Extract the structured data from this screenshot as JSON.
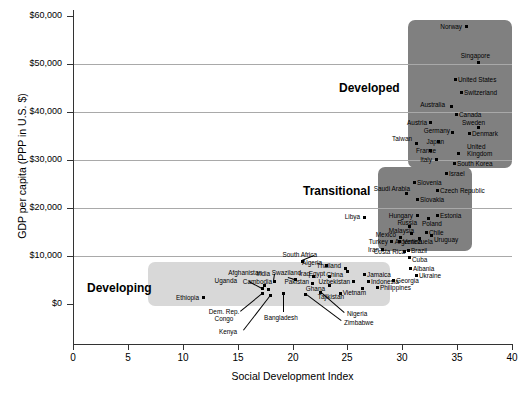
{
  "chart_data": {
    "type": "scatter",
    "title": "",
    "xlabel": "Social Development Index",
    "ylabel": "GDP per capita (PPP in U.S. $)",
    "xlim": [
      0,
      40
    ],
    "ylim": [
      -10000,
      60000
    ],
    "xticks": [
      0,
      5,
      10,
      15,
      20,
      25,
      30,
      35,
      40
    ],
    "xtick_labels": [
      "0",
      "5",
      "10",
      "15",
      "20",
      "25",
      "30",
      "35",
      "40"
    ],
    "yticks": [
      0,
      10000,
      20000,
      30000,
      40000,
      50000,
      60000
    ],
    "ytick_labels": [
      "$0",
      "$10,000",
      "$20,000",
      "$30,000",
      "$40,000",
      "$50,000",
      "$60,000"
    ],
    "grid": "horizontal",
    "legend": "none",
    "groups": [
      {
        "name": "Developing",
        "label": "Developing",
        "color": "#d8d8d8"
      },
      {
        "name": "Transitional",
        "label": "Transitional",
        "color": "#808080"
      },
      {
        "name": "Developed",
        "label": "Developed",
        "color": "#808080"
      }
    ],
    "points": [
      {
        "name": "Norway",
        "x": 32.0,
        "y": 57500,
        "group": "Developed"
      },
      {
        "name": "Singapore",
        "x": 33.2,
        "y": 49500,
        "group": "Developed"
      },
      {
        "name": "United States",
        "x": 32.3,
        "y": 45500,
        "group": "Developed"
      },
      {
        "name": "Switzerland",
        "x": 33.3,
        "y": 42800,
        "group": "Developed"
      },
      {
        "name": "Australia",
        "x": 32.7,
        "y": 40300,
        "group": "Developed"
      },
      {
        "name": "Canada",
        "x": 32.2,
        "y": 38800,
        "group": "Developed"
      },
      {
        "name": "Austria",
        "x": 31.6,
        "y": 37000,
        "group": "Developed"
      },
      {
        "name": "Sweden",
        "x": 33.3,
        "y": 36800,
        "group": "Developed"
      },
      {
        "name": "Germany",
        "x": 32.4,
        "y": 35600,
        "group": "Developed"
      },
      {
        "name": "Denmark",
        "x": 33.3,
        "y": 35400,
        "group": "Developed"
      },
      {
        "name": "Taiwan",
        "x": 29.9,
        "y": 34600,
        "group": "Developed"
      },
      {
        "name": "Japan",
        "x": 31.5,
        "y": 34000,
        "group": "Developed"
      },
      {
        "name": "United Kingdom",
        "x": 32.6,
        "y": 33200,
        "group": "Developed"
      },
      {
        "name": "France",
        "x": 31.6,
        "y": 32800,
        "group": "Developed"
      },
      {
        "name": "Italy",
        "x": 31.4,
        "y": 31400,
        "group": "Developed"
      },
      {
        "name": "South Korea",
        "x": 32.3,
        "y": 30700,
        "group": "Developed"
      },
      {
        "name": "Israel",
        "x": 31.8,
        "y": 28700,
        "group": "Developed"
      },
      {
        "name": "Slovenia",
        "x": 30.8,
        "y": 26700,
        "group": "Transitional"
      },
      {
        "name": "Saudi Arabia",
        "x": 30.0,
        "y": 25200,
        "group": "Transitional"
      },
      {
        "name": "Czech Republic",
        "x": 32.0,
        "y": 25000,
        "group": "Transitional"
      },
      {
        "name": "Slovakia",
        "x": 30.7,
        "y": 23200,
        "group": "Transitional"
      },
      {
        "name": "Hungary",
        "x": 30.5,
        "y": 19400,
        "group": "Transitional"
      },
      {
        "name": "Estonia",
        "x": 31.9,
        "y": 19300,
        "group": "Transitional"
      },
      {
        "name": "Poland",
        "x": 31.0,
        "y": 18300,
        "group": "Transitional"
      },
      {
        "name": "Russia",
        "x": 29.9,
        "y": 17700,
        "group": "Transitional"
      },
      {
        "name": "Libya",
        "x": 26.3,
        "y": 17200,
        "group": "Transitional"
      },
      {
        "name": "Malaysia",
        "x": 30.1,
        "y": 16100,
        "group": "Transitional"
      },
      {
        "name": "Chile",
        "x": 31.2,
        "y": 15700,
        "group": "Transitional"
      },
      {
        "name": "Uruguay",
        "x": 31.6,
        "y": 15000,
        "group": "Transitional"
      },
      {
        "name": "Mexico",
        "x": 29.1,
        "y": 14900,
        "group": "Transitional"
      },
      {
        "name": "Venezuela",
        "x": 29.7,
        "y": 13700,
        "group": "Transitional"
      },
      {
        "name": "Argentina",
        "x": 30.7,
        "y": 13800,
        "group": "Transitional"
      },
      {
        "name": "Turkey",
        "x": 28.2,
        "y": 13600,
        "group": "Transitional"
      },
      {
        "name": "Iran",
        "x": 26.9,
        "y": 12600,
        "group": "Transitional"
      },
      {
        "name": "Brazil",
        "x": 29.6,
        "y": 11300,
        "group": "Transitional"
      },
      {
        "name": "Costa Rica",
        "x": 28.9,
        "y": 11200,
        "group": "Transitional"
      },
      {
        "name": "Cuba",
        "x": 29.8,
        "y": 9900,
        "group": "Transitional"
      },
      {
        "name": "South Africa",
        "x": 23.8,
        "y": 10500,
        "group": "Developing"
      },
      {
        "name": "Albania",
        "x": 30.2,
        "y": 8700,
        "group": "Transitional"
      },
      {
        "name": "Ukraine",
        "x": 31.0,
        "y": 8000,
        "group": "Transitional"
      },
      {
        "name": "Thailand",
        "x": 25.0,
        "y": 9100,
        "group": "Developing"
      },
      {
        "name": "Algeria",
        "x": 23.0,
        "y": 8400,
        "group": "Developing"
      },
      {
        "name": "China",
        "x": 24.9,
        "y": 7600,
        "group": "Developing"
      },
      {
        "name": "Jamaica",
        "x": 26.4,
        "y": 7300,
        "group": "Developing"
      },
      {
        "name": "Georgia",
        "x": 28.3,
        "y": 6200,
        "group": "Developing"
      },
      {
        "name": "Egypt",
        "x": 23.3,
        "y": 6500,
        "group": "Developing"
      },
      {
        "name": "Indonesia",
        "x": 26.5,
        "y": 6300,
        "group": "Developing"
      },
      {
        "name": "Philippines",
        "x": 27.1,
        "y": 5200,
        "group": "Developing"
      },
      {
        "name": "Iraq",
        "x": 21.7,
        "y": 6400,
        "group": "Developing"
      },
      {
        "name": "Swaziland",
        "x": 20.4,
        "y": 5900,
        "group": "Developing"
      },
      {
        "name": "Uzbekistan",
        "x": 24.1,
        "y": 5100,
        "group": "Developing"
      },
      {
        "name": "Vietnam",
        "x": 26.0,
        "y": 4300,
        "group": "Developing"
      },
      {
        "name": "Pakistan",
        "x": 21.6,
        "y": 4800,
        "group": "Developing"
      },
      {
        "name": "India",
        "x": 18.7,
        "y": 5100,
        "group": "Developing"
      },
      {
        "name": "Ghana",
        "x": 22.5,
        "y": 4000,
        "group": "Developing"
      },
      {
        "name": "Tajikistan",
        "x": 23.6,
        "y": 3100,
        "group": "Developing"
      },
      {
        "name": "Afghanistan",
        "x": 17.1,
        "y": 3300,
        "group": "Developing"
      },
      {
        "name": "Cambodia",
        "x": 17.4,
        "y": 2700,
        "group": "Developing"
      },
      {
        "name": "Uganda",
        "x": 15.2,
        "y": 2500,
        "group": "Developing"
      },
      {
        "name": "Nigeria",
        "x": 22.2,
        "y": 2300,
        "group": "Developing"
      },
      {
        "name": "Zimbabwe",
        "x": 20.8,
        "y": 1700,
        "group": "Developing"
      },
      {
        "name": "Bangladesh",
        "x": 19.0,
        "y": 1900,
        "group": "Developing"
      },
      {
        "name": "Dem. Rep. Congo",
        "x": 16.3,
        "y": 1300,
        "group": "Developing"
      },
      {
        "name": "Kenya",
        "x": 17.6,
        "y": 900,
        "group": "Developing"
      },
      {
        "name": "Ethiopia",
        "x": 10.4,
        "y": 700,
        "group": "Developing"
      }
    ]
  },
  "boxes": [
    {
      "id": "developing",
      "label": "Developing",
      "color": "#d8d8d8",
      "left": 148,
      "top": 262,
      "width": 242,
      "height": 44,
      "label_left": 87,
      "label_top": 281
    },
    {
      "id": "transitional",
      "label": "Transitional",
      "color": "#808080",
      "left": 378,
      "top": 167,
      "width": 94,
      "height": 84,
      "label_left": 303,
      "label_top": 184
    },
    {
      "id": "developed",
      "label": "Developed",
      "color": "#808080",
      "left": 408,
      "top": 20,
      "width": 104,
      "height": 148,
      "label_left": 339,
      "label_top": 81
    }
  ],
  "labels": [
    {
      "t": "Norway",
      "x": 462,
      "y": 26,
      "a": "r",
      "px": 466,
      "py": 26
    },
    {
      "t": "Singapore",
      "x": 490,
      "y": 55,
      "a": "r",
      "px": 478,
      "py": 62
    },
    {
      "t": "United States",
      "x": 458,
      "y": 79,
      "a": "l",
      "px": 455,
      "py": 79
    },
    {
      "t": "Switzerland",
      "x": 464,
      "y": 92,
      "a": "l",
      "px": 461,
      "py": 92
    },
    {
      "t": "Australia",
      "x": 445,
      "y": 104,
      "a": "r",
      "px": 451,
      "py": 106
    },
    {
      "t": "Canada",
      "x": 459,
      "y": 114,
      "a": "l",
      "px": 456,
      "py": 114
    },
    {
      "t": "Sweden",
      "x": 462,
      "y": 122,
      "a": "l",
      "px": 478,
      "py": 127
    },
    {
      "t": "Austria",
      "x": 427,
      "y": 122,
      "a": "r",
      "px": 430,
      "py": 122
    },
    {
      "t": "Germany",
      "x": 450,
      "y": 130,
      "a": "r",
      "px": 452,
      "py": 132
    },
    {
      "t": "Denmark",
      "x": 472,
      "y": 133,
      "a": "l",
      "px": 469,
      "py": 133
    },
    {
      "t": "Taiwan",
      "x": 412,
      "y": 138,
      "a": "r",
      "px": 416,
      "py": 143
    },
    {
      "t": "Japan",
      "x": 444,
      "y": 141,
      "a": "r",
      "px": 438,
      "py": 141
    },
    {
      "t": "France",
      "x": 436,
      "y": 150,
      "a": "r",
      "px": 430,
      "py": 150
    },
    {
      "t": "United",
      "x": 467,
      "y": 146,
      "a": "l",
      "px": 458,
      "py": 153
    },
    {
      "t": "Kingdom",
      "x": 467,
      "y": 153,
      "a": "l",
      "px": null,
      "py": null
    },
    {
      "t": "Italy",
      "x": 432,
      "y": 159,
      "a": "r",
      "px": 436,
      "py": 159
    },
    {
      "t": "South Korea",
      "x": 457,
      "y": 163,
      "a": "l",
      "px": 454,
      "py": 163
    },
    {
      "t": "Israel",
      "x": 449,
      "y": 173,
      "a": "l",
      "px": 446,
      "py": 173
    },
    {
      "t": "Slovenia",
      "x": 417,
      "y": 182,
      "a": "l",
      "px": 414,
      "py": 182
    },
    {
      "t": "Saudi Arabia",
      "x": 410,
      "y": 188,
      "a": "r",
      "px": 406,
      "py": 193
    },
    {
      "t": "Czech Republic",
      "x": 440,
      "y": 190,
      "a": "l",
      "px": 437,
      "py": 190
    },
    {
      "t": "Slovakia",
      "x": 420,
      "y": 199,
      "a": "l",
      "px": 417,
      "py": 199
    },
    {
      "t": "Hungary",
      "x": 413,
      "y": 215,
      "a": "r",
      "px": 417,
      "py": 215
    },
    {
      "t": "Estonia",
      "x": 440,
      "y": 215,
      "a": "l",
      "px": 437,
      "py": 215
    },
    {
      "t": "Poland",
      "x": 422,
      "y": 223,
      "a": "l",
      "px": 428,
      "py": 218
    },
    {
      "t": "Russia",
      "x": 417,
      "y": 222,
      "a": "r",
      "px": 409,
      "py": 226
    },
    {
      "t": "Libya",
      "x": 360,
      "y": 216,
      "a": "r",
      "px": 364,
      "py": 217
    },
    {
      "t": "Malaysia",
      "x": 414,
      "y": 230,
      "a": "r",
      "px": 411,
      "py": 233
    },
    {
      "t": "Chile",
      "x": 429,
      "y": 232,
      "a": "l",
      "px": 426,
      "py": 232
    },
    {
      "t": "Uruguay",
      "x": 434,
      "y": 239,
      "a": "l",
      "px": 431,
      "py": 235
    },
    {
      "t": "Mexico",
      "x": 396,
      "y": 234,
      "a": "r",
      "px": 400,
      "py": 237
    },
    {
      "t": "Venezuela",
      "x": 403,
      "y": 241,
      "a": "l",
      "px": 399,
      "py": 241
    },
    {
      "t": "Argentina",
      "x": 422,
      "y": 241,
      "a": "r",
      "px": 419,
      "py": 238
    },
    {
      "t": "Turkey",
      "x": 388,
      "y": 241,
      "a": "r",
      "px": 391,
      "py": 241
    },
    {
      "t": "Iran",
      "x": 379,
      "y": 249,
      "a": "r",
      "px": 382,
      "py": 249
    },
    {
      "t": "Brazil",
      "x": 411,
      "y": 250,
      "a": "l",
      "px": 408,
      "py": 250
    },
    {
      "t": "Costa Rica",
      "x": 405,
      "y": 251,
      "a": "r",
      "px": 404,
      "py": 251
    },
    {
      "t": "Cuba",
      "x": 412,
      "y": 259,
      "a": "l",
      "px": 409,
      "py": 257
    },
    {
      "t": "South Africa",
      "x": 317,
      "y": 254,
      "a": "r",
      "px": 302,
      "py": 261
    },
    {
      "t": "Albania",
      "x": 413,
      "y": 268,
      "a": "l",
      "px": 410,
      "py": 268
    },
    {
      "t": "Ukraine",
      "x": 419,
      "y": 275,
      "a": "l",
      "px": 416,
      "py": 275
    },
    {
      "t": "Thailand",
      "x": 341,
      "y": 265,
      "a": "r",
      "px": 345,
      "py": 268
    },
    {
      "t": "Algeria",
      "x": 322,
      "y": 262,
      "a": "r",
      "px": 326,
      "py": 265
    },
    {
      "t": "China",
      "x": 343,
      "y": 274,
      "a": "r",
      "px": 347,
      "py": 271
    },
    {
      "t": "Jamaica",
      "x": 367,
      "y": 274,
      "a": "l",
      "px": 364,
      "py": 274
    },
    {
      "t": "Georgia",
      "x": 396,
      "y": 280,
      "a": "l",
      "px": 393,
      "py": 280
    },
    {
      "t": "Egypt",
      "x": 325,
      "y": 273,
      "a": "r",
      "px": 329,
      "py": 276
    },
    {
      "t": "Indonesia",
      "x": 371,
      "y": 281,
      "a": "l",
      "px": 368,
      "py": 281
    },
    {
      "t": "Philippines",
      "x": 380,
      "y": 287,
      "a": "l",
      "px": 377,
      "py": 287
    },
    {
      "t": "Iraq",
      "x": 310,
      "y": 273,
      "a": "r",
      "px": 313,
      "py": 276
    },
    {
      "t": "Swaziland",
      "x": 301,
      "y": 272,
      "a": "r",
      "px": 295,
      "py": 279
    },
    {
      "t": "Uzbekistan",
      "x": 350,
      "y": 281,
      "a": "r",
      "px": 353,
      "py": 281
    },
    {
      "t": "Vietnam",
      "x": 366,
      "y": 292,
      "a": "r",
      "px": 362,
      "py": 288
    },
    {
      "t": "Pakistan",
      "x": 309,
      "y": 281,
      "a": "r",
      "px": 312,
      "py": 283
    },
    {
      "t": "India",
      "x": 270,
      "y": 273,
      "a": "r",
      "px": 274,
      "py": 281
    },
    {
      "t": "Ghana",
      "x": 325,
      "y": 288,
      "a": "r",
      "px": 329,
      "py": 285
    },
    {
      "t": "Tajikistan",
      "x": 344,
      "y": 296,
      "a": "r",
      "px": 340,
      "py": 293
    },
    {
      "t": "Afghanistan",
      "x": 262,
      "y": 272,
      "a": "r",
      "px": 264,
      "py": 285
    },
    {
      "t": "Cambodia",
      "x": 272,
      "y": 281,
      "a": "r",
      "px": 268,
      "py": 289
    },
    {
      "t": "Uganda",
      "x": 237,
      "y": 280,
      "a": "r",
      "px": 262,
      "py": 288
    },
    {
      "t": "Nigeria",
      "x": 347,
      "y": 313,
      "a": "l",
      "px": 320,
      "py": 292
    },
    {
      "t": "Zimbabwe",
      "x": 344,
      "y": 322,
      "a": "l",
      "px": 305,
      "py": 294
    },
    {
      "t": "Bangladesh",
      "x": 281,
      "y": 317,
      "a": "c",
      "px": 283,
      "py": 293
    },
    {
      "t": "Dem. Rep.",
      "x": 224,
      "y": 311,
      "a": "c",
      "px": 262,
      "py": 293
    },
    {
      "t": "Congo",
      "x": 224,
      "y": 318,
      "a": "c",
      "px": null,
      "py": null
    },
    {
      "t": "Kenya",
      "x": 228,
      "y": 331,
      "a": "c",
      "px": 270,
      "py": 295
    },
    {
      "t": "Ethiopia",
      "x": 199,
      "y": 297,
      "a": "r",
      "px": 203,
      "py": 297
    }
  ],
  "leaders": [
    {
      "x1": 249,
      "y1": 281,
      "x2": 262,
      "y2": 288
    },
    {
      "x1": 240,
      "y1": 311,
      "x2": 262,
      "y2": 293
    },
    {
      "x1": 243,
      "y1": 330,
      "x2": 270,
      "y2": 295
    },
    {
      "x1": 283,
      "y1": 312,
      "x2": 283,
      "y2": 293
    },
    {
      "x1": 344,
      "y1": 313,
      "x2": 320,
      "y2": 292
    },
    {
      "x1": 341,
      "y1": 321,
      "x2": 305,
      "y2": 294
    },
    {
      "x1": 288,
      "y1": 277,
      "x2": 295,
      "y2": 279
    },
    {
      "x1": 275,
      "y1": 274,
      "x2": 274,
      "y2": 281
    },
    {
      "x1": 314,
      "y1": 256,
      "x2": 302,
      "y2": 261
    }
  ],
  "axes": {
    "x_title": "Social Development Index",
    "y_title": "GDP per capita (PPP in U.S. $)",
    "x_ticks": [
      {
        "label": "0",
        "px": 73
      },
      {
        "label": "5",
        "px": 128
      },
      {
        "label": "10",
        "px": 183
      },
      {
        "label": "15",
        "px": 238
      },
      {
        "label": "20",
        "px": 293
      },
      {
        "label": "25",
        "px": 347
      },
      {
        "label": "30",
        "px": 402
      },
      {
        "label": "35",
        "px": 457
      },
      {
        "label": "40",
        "px": 512
      }
    ],
    "y_ticks": [
      {
        "label": "$60,000",
        "py": 16,
        "grid": false
      },
      {
        "label": "$50,000",
        "py": 64,
        "grid": true
      },
      {
        "label": "$40,000",
        "py": 112,
        "grid": true
      },
      {
        "label": "$30,000",
        "py": 160,
        "grid": true
      },
      {
        "label": "$20,000",
        "py": 208,
        "grid": true
      },
      {
        "label": "$10,000",
        "py": 256,
        "grid": true
      },
      {
        "label": "$0",
        "py": 304,
        "grid": false
      }
    ]
  }
}
